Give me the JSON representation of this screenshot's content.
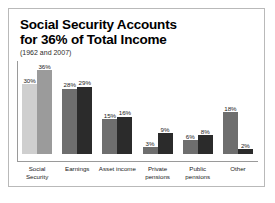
{
  "chart_data": {
    "type": "bar",
    "title": "Social Security Accounts for 36% of Total Income",
    "title_line1": "Social Security Accounts",
    "title_line2": "for 36% of Total Income",
    "subtitle": "(1962 and 2007)",
    "xlabel": "",
    "ylabel": "",
    "ylim": [
      0,
      40
    ],
    "grid": false,
    "legend": "none",
    "categories": [
      "Social Security",
      "Earnings",
      "Asset income",
      "Private pensions",
      "Public pensions",
      "Other"
    ],
    "category_lines": [
      [
        "Social Security"
      ],
      [
        "Earnings"
      ],
      [
        "Asset income"
      ],
      [
        "Private",
        "pensions"
      ],
      [
        "Public",
        "pensions"
      ],
      [
        "Other"
      ]
    ],
    "series": [
      {
        "name": "1962",
        "color": "#b6b6b6",
        "values": [
          30,
          28,
          15,
          3,
          6,
          18
        ],
        "labels": [
          "30%",
          "28%",
          "15%",
          "3%",
          "6%",
          "18%"
        ]
      },
      {
        "name": "2007",
        "color": "#3d3d3d",
        "values": [
          36,
          29,
          16,
          9,
          8,
          2
        ],
        "labels": [
          "36%",
          "29%",
          "16%",
          "9%",
          "8%",
          "2%"
        ]
      }
    ],
    "series_color_overrides": {
      "0": {
        "bar1": "#cfcfcf",
        "bar2": "#9b9b9b"
      },
      "1": {
        "bar1": "#6e6e6e",
        "bar2": "#2b2b2b"
      },
      "2": {
        "bar1": "#6e6e6e",
        "bar2": "#2b2b2b"
      },
      "3": {
        "bar1": "#6e6e6e",
        "bar2": "#2b2b2b"
      },
      "4": {
        "bar1": "#6e6e6e",
        "bar2": "#2b2b2b"
      },
      "5": {
        "bar1": "#6e6e6e",
        "bar2": "#2b2b2b"
      }
    }
  }
}
